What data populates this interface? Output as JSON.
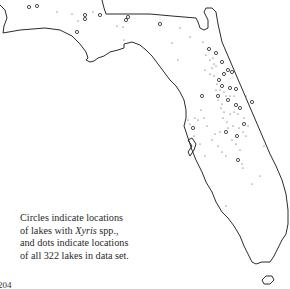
{
  "figure": {
    "caption": {
      "line1": "Circles indicate locations",
      "line2_pre": "of lakes with ",
      "line2_genus": "Xyris",
      "line2_post": " spp.,",
      "line3": "and dots indicate locations",
      "line4": "of all 322 lakes in data set."
    },
    "page_number": "204",
    "total_lakes": 322,
    "colors": {
      "outline": "#2b2b2b",
      "markers": "#3a3a3a",
      "background": "#ffffff"
    }
  },
  "legend": {
    "circle": "lakes with Xyris spp.",
    "dot": "all 322 lakes in data set"
  }
}
